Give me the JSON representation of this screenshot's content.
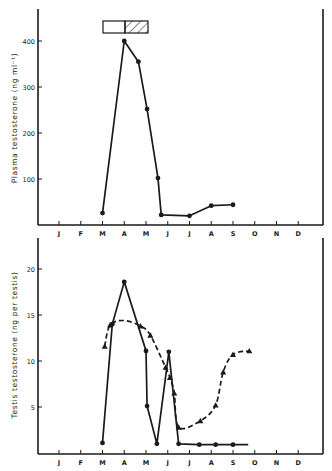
{
  "chart_data": [
    {
      "type": "line",
      "title": "",
      "xlabel": "",
      "ylabel": "Plasma testosterone (ng ml⁻¹)",
      "categories": [
        "J",
        "F",
        "M",
        "A",
        "M",
        "J",
        "J",
        "A",
        "S",
        "O",
        "N",
        "D"
      ],
      "yticks": [
        100,
        200,
        300,
        400
      ],
      "ylim": [
        0,
        470
      ],
      "grid": false,
      "legend": null,
      "annotation": {
        "type": "bar",
        "description": "Horizontal bar above peak: open segment (March–April) followed by hatched segment (April–May)",
        "segments": [
          {
            "from_month": 3.0,
            "to_month": 4.0,
            "fill": "open"
          },
          {
            "from_month": 4.0,
            "to_month": 5.0,
            "fill": "hatched"
          }
        ]
      },
      "series": [
        {
          "name": "Plasma testosterone",
          "marker": "circle",
          "line": "solid",
          "points": [
            {
              "month": 3.0,
              "value": 26
            },
            {
              "month": 4.0,
              "value": 400
            },
            {
              "month": 4.65,
              "value": 355
            },
            {
              "month": 5.05,
              "value": 252
            },
            {
              "month": 5.55,
              "value": 102
            },
            {
              "month": 5.7,
              "value": 22
            },
            {
              "month": 7.0,
              "value": 20
            },
            {
              "month": 8.0,
              "value": 42
            },
            {
              "month": 9.0,
              "value": 44
            }
          ]
        }
      ]
    },
    {
      "type": "line",
      "title": "",
      "xlabel": "",
      "ylabel": "Testis testosterone (ng per testis)",
      "categories": [
        "J",
        "F",
        "M",
        "A",
        "M",
        "J",
        "J",
        "A",
        "S",
        "O",
        "N",
        "D"
      ],
      "yticks": [
        5,
        10,
        15,
        20
      ],
      "ylim": [
        0,
        23.5
      ],
      "grid": false,
      "legend": null,
      "series": [
        {
          "name": "Series 1 (circles, solid)",
          "marker": "circle",
          "line": "solid",
          "points": [
            {
              "month": 3.0,
              "value": 1.1
            },
            {
              "month": 3.45,
              "value": 14.0
            },
            {
              "month": 4.0,
              "value": 18.6
            },
            {
              "month": 5.0,
              "value": 11.1
            },
            {
              "month": 5.05,
              "value": 5.1
            },
            {
              "month": 5.5,
              "value": 1.0
            },
            {
              "month": 6.05,
              "value": 11.0
            },
            {
              "month": 6.5,
              "value": 1.0
            },
            {
              "month": 7.45,
              "value": 0.9
            },
            {
              "month": 8.2,
              "value": 0.9
            },
            {
              "month": 9.0,
              "value": 0.9
            },
            {
              "month": 9.7,
              "value": 0.9,
              "marker": false
            }
          ]
        },
        {
          "name": "Series 2 (triangles, dashed)",
          "marker": "triangle",
          "line": "dashed",
          "points": [
            {
              "month": 3.1,
              "value": 11.6
            },
            {
              "month": 3.35,
              "value": 13.9
            },
            {
              "month": 4.0,
              "value": 14.4,
              "marker": false
            },
            {
              "month": 4.75,
              "value": 13.8
            },
            {
              "month": 5.2,
              "value": 12.8
            },
            {
              "month": 5.9,
              "value": 9.3
            },
            {
              "month": 6.1,
              "value": 8.2
            },
            {
              "month": 6.3,
              "value": 6.5
            },
            {
              "month": 6.5,
              "value": 2.8
            },
            {
              "month": 7.5,
              "value": 3.5
            },
            {
              "month": 8.2,
              "value": 5.2
            },
            {
              "month": 8.55,
              "value": 8.8
            },
            {
              "month": 9.0,
              "value": 10.7
            },
            {
              "month": 9.75,
              "value": 11.1
            }
          ]
        }
      ]
    }
  ],
  "top_panel": {
    "y_axis_label": "Plasma testosterone (ng ml⁻¹)",
    "y_tick_labels": [
      "100",
      "200",
      "300",
      "400"
    ],
    "x_tick_labels": [
      "J",
      "F",
      "M",
      "A",
      "M",
      "J",
      "J",
      "A",
      "S",
      "O",
      "N",
      "D"
    ]
  },
  "bottom_panel": {
    "y_axis_label": "Testis testosterone (ng per testis)",
    "y_tick_labels": [
      "5",
      "10",
      "15",
      "20"
    ],
    "x_tick_labels": [
      "J",
      "F",
      "M",
      "A",
      "M",
      "J",
      "J",
      "A",
      "S",
      "O",
      "N",
      "D"
    ]
  },
  "colors": {
    "ink": "#1a1a1a",
    "background": "#ffffff"
  }
}
